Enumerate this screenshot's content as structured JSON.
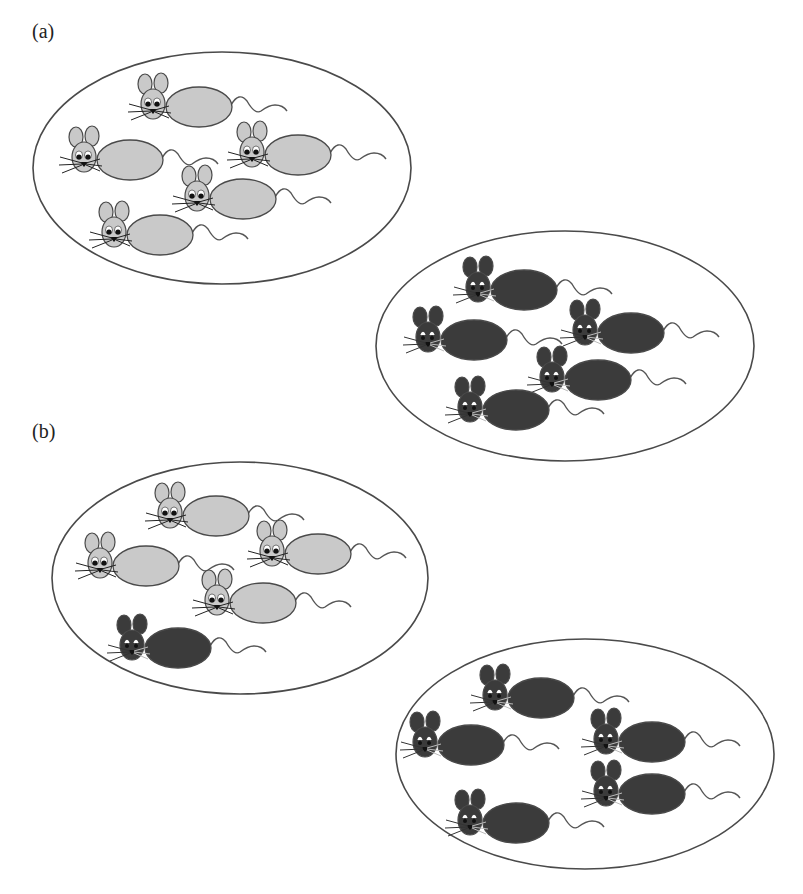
{
  "figure": {
    "panels": [
      {
        "id": "a",
        "label": "(a)",
        "label_pos": [
          32,
          22
        ],
        "populations": [
          {
            "name": "population-1",
            "ellipse": {
              "cx": 222,
              "cy": 168,
              "rx": 189,
              "ry": 116
            },
            "mice": [
              {
                "x": 153,
                "y": 104,
                "color": "light"
              },
              {
                "x": 84,
                "y": 157,
                "color": "light"
              },
              {
                "x": 252,
                "y": 152,
                "color": "light"
              },
              {
                "x": 197,
                "y": 196,
                "color": "light"
              },
              {
                "x": 114,
                "y": 232,
                "color": "light"
              }
            ]
          },
          {
            "name": "population-2",
            "ellipse": {
              "cx": 565,
              "cy": 346,
              "rx": 189,
              "ry": 115
            },
            "mice": [
              {
                "x": 478,
                "y": 287,
                "color": "dark"
              },
              {
                "x": 428,
                "y": 337,
                "color": "dark"
              },
              {
                "x": 585,
                "y": 330,
                "color": "dark"
              },
              {
                "x": 552,
                "y": 377,
                "color": "dark"
              },
              {
                "x": 470,
                "y": 407,
                "color": "dark"
              }
            ]
          }
        ]
      },
      {
        "id": "b",
        "label": "(b)",
        "label_pos": [
          32,
          422
        ],
        "populations": [
          {
            "name": "population-1",
            "ellipse": {
              "cx": 240,
              "cy": 578,
              "rx": 188,
              "ry": 116
            },
            "mice": [
              {
                "x": 170,
                "y": 513,
                "color": "light"
              },
              {
                "x": 100,
                "y": 563,
                "color": "light"
              },
              {
                "x": 272,
                "y": 551,
                "color": "light"
              },
              {
                "x": 217,
                "y": 600,
                "color": "light"
              },
              {
                "x": 132,
                "y": 645,
                "color": "dark"
              }
            ]
          },
          {
            "name": "population-2",
            "ellipse": {
              "cx": 585,
              "cy": 754,
              "rx": 189,
              "ry": 115
            },
            "mice": [
              {
                "x": 495,
                "y": 695,
                "color": "dark"
              },
              {
                "x": 425,
                "y": 742,
                "color": "dark"
              },
              {
                "x": 606,
                "y": 739,
                "color": "dark"
              },
              {
                "x": 606,
                "y": 791,
                "color": "dark"
              },
              {
                "x": 470,
                "y": 820,
                "color": "dark"
              }
            ]
          }
        ]
      }
    ],
    "colors": {
      "light_fill": "#c9c9c9",
      "dark_fill": "#3b3b3b",
      "outline": "#4a4a4a",
      "ellipse_stroke": "#4a4a4a",
      "tail": "#555555"
    }
  }
}
